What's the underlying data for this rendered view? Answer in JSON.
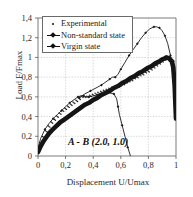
{
  "chart_data": {
    "type": "line",
    "title": "",
    "xlabel": "Displacement U/Umax",
    "ylabel": "Load F/Fmax",
    "xlim": [
      0,
      1
    ],
    "ylim": [
      0,
      1.4
    ],
    "xticks": [
      "0",
      "0,2",
      "0,4",
      "0,6",
      "0,8",
      "1"
    ],
    "xtick_values": [
      0,
      0.2,
      0.4,
      0.6,
      0.8,
      1.0
    ],
    "yticks": [
      "0",
      "0,2",
      "0,4",
      "0,6",
      "0,8",
      "1",
      "1,2",
      "1,4"
    ],
    "ytick_values": [
      0,
      0.2,
      0.4,
      0.6,
      0.8,
      1.0,
      1.2,
      1.4
    ],
    "grid": true,
    "legend_position": "top-left",
    "annotation": "A - B (2.0, 1.0)",
    "series": [
      {
        "name": "Experimental",
        "marker": "dot",
        "style": "points",
        "x": [
          0.0,
          0.02,
          0.04,
          0.06,
          0.08,
          0.1,
          0.12,
          0.14,
          0.16,
          0.18,
          0.2,
          0.22,
          0.24,
          0.26,
          0.28,
          0.3,
          0.32,
          0.34,
          0.36,
          0.38,
          0.4,
          0.42,
          0.44,
          0.46,
          0.48,
          0.5,
          0.52,
          0.54,
          0.56,
          0.58,
          0.6,
          0.62,
          0.64,
          0.66,
          0.68,
          0.7,
          0.72,
          0.74,
          0.76,
          0.78,
          0.8,
          0.82,
          0.84,
          0.86,
          0.88,
          0.9,
          0.92,
          0.94,
          0.96,
          0.98,
          1.0
        ],
        "y": [
          0.07,
          0.13,
          0.19,
          0.25,
          0.3,
          0.34,
          0.37,
          0.4,
          0.43,
          0.46,
          0.48,
          0.5,
          0.52,
          0.54,
          0.56,
          0.58,
          0.6,
          0.6,
          0.6,
          0.61,
          0.62,
          0.63,
          0.64,
          0.65,
          0.66,
          0.67,
          0.68,
          0.69,
          0.7,
          0.71,
          0.72,
          0.73,
          0.75,
          0.76,
          0.77,
          0.79,
          0.8,
          0.82,
          0.83,
          0.85,
          0.86,
          0.88,
          0.9,
          0.92,
          0.94,
          0.96,
          0.98,
          0.99,
          1.0,
          0.97,
          0.4
        ]
      },
      {
        "name": "Non-standard state",
        "marker": "diamond",
        "style": "line",
        "x": [
          0.0,
          0.02,
          0.05,
          0.08,
          0.11,
          0.14,
          0.17,
          0.2,
          0.23,
          0.26,
          0.29,
          0.31,
          0.33,
          0.35,
          0.37,
          0.4,
          0.43,
          0.46,
          0.49,
          0.52,
          0.55,
          0.57,
          0.58,
          0.59,
          0.61,
          0.63,
          0.65,
          0.67
        ],
        "y": [
          0.08,
          0.18,
          0.27,
          0.33,
          0.38,
          0.42,
          0.46,
          0.5,
          0.54,
          0.57,
          0.6,
          0.61,
          0.61,
          0.6,
          0.6,
          0.61,
          0.62,
          0.63,
          0.64,
          0.64,
          0.63,
          0.58,
          0.5,
          0.42,
          0.31,
          0.2,
          0.09,
          0.0
        ]
      },
      {
        "name": "Non-standard state branch 2",
        "marker": "diamond",
        "style": "line",
        "x": [
          0.3,
          0.34,
          0.38,
          0.42,
          0.46,
          0.5,
          0.52,
          0.54,
          0.56,
          0.58,
          0.6,
          0.63,
          0.66,
          0.69,
          0.72,
          0.75,
          0.78,
          0.81,
          0.84,
          0.86,
          0.88,
          0.9,
          0.92,
          0.94,
          0.96,
          0.97,
          0.98,
          0.99,
          1.0
        ],
        "y": [
          0.59,
          0.63,
          0.66,
          0.69,
          0.72,
          0.76,
          0.78,
          0.8,
          0.8,
          0.83,
          0.88,
          0.95,
          1.02,
          1.08,
          1.14,
          1.2,
          1.25,
          1.29,
          1.31,
          1.31,
          1.3,
          1.27,
          1.22,
          1.14,
          1.02,
          0.92,
          0.78,
          0.6,
          0.38
        ]
      },
      {
        "name": "Virgin state",
        "marker": "diamond",
        "style": "thick-band",
        "x": [
          0.0,
          0.02,
          0.04,
          0.06,
          0.08,
          0.1,
          0.13,
          0.16,
          0.19,
          0.22,
          0.25,
          0.28,
          0.31,
          0.34,
          0.37,
          0.4,
          0.43,
          0.46,
          0.49,
          0.52,
          0.55,
          0.58,
          0.61,
          0.64,
          0.67,
          0.7,
          0.73,
          0.76,
          0.79,
          0.82,
          0.85,
          0.88,
          0.9,
          0.92,
          0.93,
          0.95,
          0.97,
          0.98,
          0.99,
          1.0
        ],
        "y": [
          0.04,
          0.1,
          0.15,
          0.19,
          0.23,
          0.26,
          0.3,
          0.34,
          0.37,
          0.4,
          0.43,
          0.46,
          0.49,
          0.52,
          0.54,
          0.57,
          0.59,
          0.62,
          0.64,
          0.66,
          0.69,
          0.71,
          0.74,
          0.76,
          0.79,
          0.81,
          0.84,
          0.86,
          0.89,
          0.91,
          0.94,
          0.96,
          0.98,
          0.99,
          1.0,
          0.99,
          0.96,
          0.9,
          0.72,
          0.38
        ]
      }
    ]
  },
  "legend": {
    "items": [
      {
        "label": "Experimental",
        "key": "dot-marker"
      },
      {
        "label": "Non-standard state",
        "key": "line-diamond-marker"
      },
      {
        "label": "Virgin state",
        "key": "line-diamond-marker"
      }
    ]
  },
  "axes": {
    "y_label": "Load F/Fmax",
    "x_label": "Displacement U/Umax",
    "y_ticks": [
      "1,4",
      "1,2",
      "1",
      "0,8",
      "0,6",
      "0,4",
      "0,2",
      "0"
    ],
    "x_ticks": [
      "0",
      "0,2",
      "0,4",
      "0,6",
      "0,8",
      "1"
    ]
  },
  "annotation": {
    "text": "A - B (2.0, 1.0)"
  },
  "colors": {
    "curve": "#111111",
    "axis": "#777777",
    "grid": "#b8b8b8",
    "background": "#ffffff"
  }
}
